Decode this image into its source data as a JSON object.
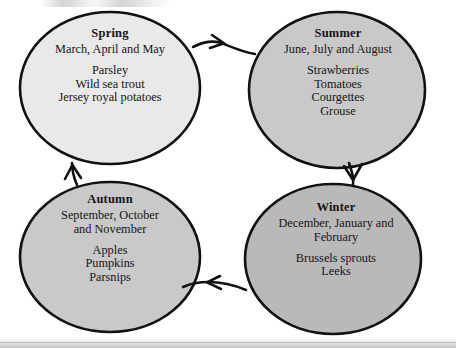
{
  "diagram": {
    "type": "seasonal-cycle",
    "colors": {
      "spring_fill": "#e9e9e9",
      "summer_fill": "#c9c9c9",
      "autumn_fill": "#c9c9c9",
      "winter_fill": "#b9b9b9",
      "stroke": "#111111",
      "text": "#151515",
      "background": "#ffffff"
    },
    "nodes": [
      {
        "id": "spring",
        "title": "Spring",
        "months": "March, April and May",
        "items": [
          "Parsley",
          "Wild sea trout",
          "Jersey royal potatoes"
        ]
      },
      {
        "id": "summer",
        "title": "Summer",
        "months": "June, July and August",
        "items": [
          "Strawberries",
          "Tomatoes",
          "Courgettes",
          "Grouse"
        ]
      },
      {
        "id": "autumn",
        "title": "Autumn",
        "months": "September, October and November",
        "months_line1": "September, October",
        "months_line2": "and November",
        "items": [
          "Apples",
          "Pumpkins",
          "Parsnips"
        ]
      },
      {
        "id": "winter",
        "title": "Winter",
        "months": "December, January and February",
        "months_line1": "December, January and",
        "months_line2": "February",
        "items": [
          "Brussels sprouts",
          "Leeks"
        ]
      }
    ],
    "arrows": [
      {
        "id": "spring-to-summer",
        "from": "spring",
        "to": "summer",
        "direction": "right"
      },
      {
        "id": "summer-to-winter",
        "from": "summer",
        "to": "winter",
        "direction": "down"
      },
      {
        "id": "winter-to-autumn",
        "from": "winter",
        "to": "autumn",
        "direction": "left"
      },
      {
        "id": "autumn-to-spring",
        "from": "autumn",
        "to": "spring",
        "direction": "up"
      }
    ]
  }
}
